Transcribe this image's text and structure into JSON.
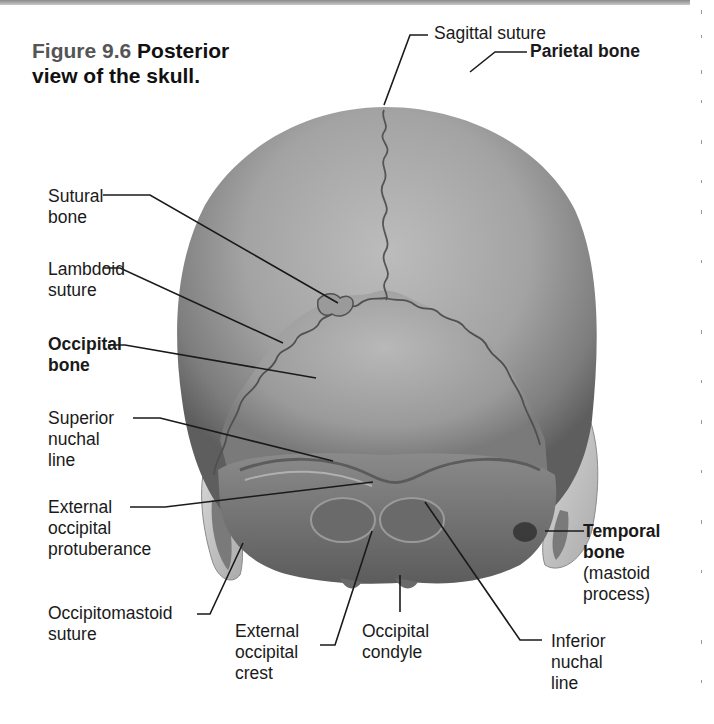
{
  "figure": {
    "number": "Figure 9.6",
    "title_line1": "Posterior",
    "title_line2": "view of the skull."
  },
  "labels": {
    "sagittal_suture": "Sagittal suture",
    "parietal_bone": "Parietal bone",
    "sutural_bone": [
      "Sutural",
      "bone"
    ],
    "lambdoid_suture": [
      "Lambdoid",
      "suture"
    ],
    "occipital_bone": [
      "Occipital",
      "bone"
    ],
    "superior_nuchal_line": [
      "Superior",
      "nuchal",
      "line"
    ],
    "external_occipital_protuberance": [
      "External",
      "occipital",
      "protuberance"
    ],
    "occipitomastoid_suture": [
      "Occipitomastoid",
      "suture"
    ],
    "external_occipital_crest": [
      "External",
      "occipital",
      "crest"
    ],
    "occipital_condyle": [
      "Occipital",
      "condyle"
    ],
    "inferior_nuchal_line": [
      "Inferior",
      "nuchal",
      "line"
    ],
    "temporal_bone": [
      "Temporal",
      "bone"
    ],
    "temporal_bone_note": [
      "(mastoid",
      "process)"
    ]
  },
  "colors": {
    "bone_light": "#b9b9b9",
    "bone_mid": "#8e8e8e",
    "bone_dark": "#5a5a5a",
    "temporal": "#c9c9c9",
    "leader": "#1a1a1a"
  }
}
